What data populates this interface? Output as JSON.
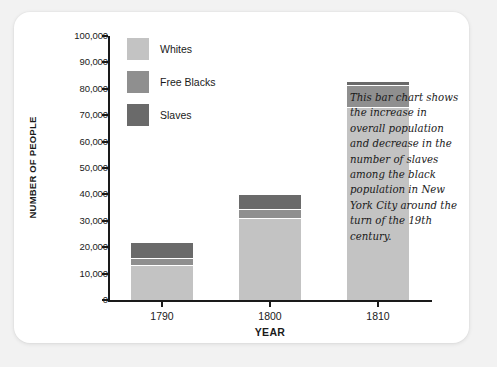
{
  "card": {
    "background": "#ffffff",
    "page_background": "#f2f2f2"
  },
  "annotation": {
    "text": "This bar chart shows the increase in overall population and decrease in the number of slaves among the black population in New York City around the turn of the 19th century."
  },
  "chart_data": {
    "type": "bar",
    "stacked": true,
    "title": "",
    "xlabel": "YEAR",
    "ylabel": "NUMBER OF PEOPLE",
    "categories": [
      "1790",
      "1800",
      "1810"
    ],
    "ylim": [
      0,
      100000
    ],
    "ytick_step": 10000,
    "ytick_labels": [
      "0",
      "10,000",
      "20,000",
      "30,000",
      "40,000",
      "50,000",
      "60,000",
      "70,000",
      "80,000",
      "90,000",
      "100,000"
    ],
    "ytick_values": [
      0,
      10000,
      20000,
      30000,
      40000,
      50000,
      60000,
      70000,
      80000,
      90000,
      100000
    ],
    "grid": false,
    "legend_position": "upper-left-inside",
    "series": [
      {
        "name": "Whites",
        "color": "#c3c3c3",
        "values": [
          13300,
          31000,
          73000
        ]
      },
      {
        "name": "Free Blacks",
        "color": "#8f8f8f",
        "values": [
          2700,
          3500,
          8500
        ]
      },
      {
        "name": "Slaves",
        "color": "#6a6a6a",
        "values": [
          6000,
          5500,
          1500
        ]
      }
    ],
    "totals": [
      22000,
      40000,
      83000
    ]
  }
}
